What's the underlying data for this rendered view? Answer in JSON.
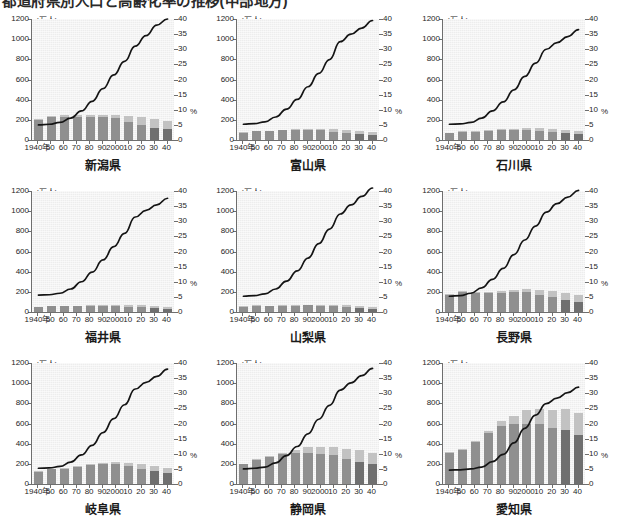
{
  "heading": {
    "text": "都道府県別人口と高齢化率の推移(中部地方)"
  },
  "axes": {
    "left_unit": "(万人)",
    "right_unit": "%",
    "left_ticks": [
      "1200",
      "1000",
      "800",
      "600",
      "400",
      "200",
      "0"
    ],
    "left_tick_values": [
      1200,
      1000,
      800,
      600,
      400,
      200,
      0
    ],
    "right_ticks": [
      "40",
      "35",
      "30",
      "25",
      "20",
      "15",
      "10",
      "5",
      "0"
    ],
    "right_tick_values": [
      40,
      35,
      30,
      25,
      20,
      15,
      10,
      5,
      0
    ],
    "x_ticks": [
      "1940年",
      "50",
      "60",
      "70",
      "80",
      "90",
      "2000",
      "10",
      "20",
      "30",
      "40"
    ],
    "left_range": [
      0,
      1200
    ],
    "right_range": [
      0,
      40
    ],
    "grid": false,
    "legend_position": "none"
  },
  "colors": {
    "panel_background": "#ededed",
    "axis": "#6e6e6e",
    "bar_lower": "#8f8f8f",
    "bar_upper": "#c2c2c2",
    "bar_lower_dark": "#6f6f6f",
    "line": "#141414",
    "text": "#262626"
  },
  "chart_data": [
    {
      "type": "bar",
      "title": "新潟県",
      "xlabel": "",
      "ylabel": "(万人)",
      "ylim": [
        0,
        1200
      ],
      "y2lim": [
        0,
        40
      ],
      "y2label": "%",
      "categories": [
        "1940年",
        "50",
        "60",
        "70",
        "80",
        "90",
        "2000",
        "10",
        "20",
        "30",
        "40"
      ],
      "series": [
        {
          "name": "bar-lower",
          "values": [
            200,
            228,
            232,
            232,
            228,
            224,
            216,
            176,
            148,
            120,
            108
          ]
        },
        {
          "name": "bar-upper",
          "values": [
            6,
            12,
            12,
            12,
            16,
            20,
            28,
            58,
            76,
            84,
            76
          ]
        },
        {
          "name": "aging-rate-line",
          "axis": "right",
          "values": [
            5.0,
            5.2,
            5.8,
            7.2,
            9.6,
            12.8,
            17.0,
            21.5,
            26.0,
            31.0,
            34.5,
            38.0,
            40.0
          ]
        }
      ]
    },
    {
      "type": "bar",
      "title": "富山県",
      "xlabel": "",
      "ylabel": "(万人)",
      "ylim": [
        0,
        1200
      ],
      "y2lim": [
        0,
        40
      ],
      "y2label": "%",
      "categories": [
        "1940年",
        "50",
        "60",
        "70",
        "80",
        "90",
        "2000",
        "10",
        "20",
        "30",
        "40"
      ],
      "series": [
        {
          "name": "bar-lower",
          "values": [
            72,
            88,
            88,
            96,
            100,
            100,
            96,
            84,
            72,
            60,
            52
          ]
        },
        {
          "name": "bar-upper",
          "values": [
            4,
            6,
            6,
            8,
            8,
            12,
            16,
            24,
            32,
            32,
            28
          ]
        },
        {
          "name": "aging-rate-line",
          "axis": "right",
          "values": [
            5.2,
            5.4,
            6.0,
            7.6,
            10.2,
            13.4,
            17.6,
            22.0,
            26.6,
            32.5,
            35.0,
            37.0,
            39.5
          ]
        }
      ]
    },
    {
      "type": "bar",
      "title": "石川県",
      "xlabel": "",
      "ylabel": "(万人)",
      "ylim": [
        0,
        1200
      ],
      "y2lim": [
        0,
        40
      ],
      "y2label": "%",
      "categories": [
        "1940年",
        "50",
        "60",
        "70",
        "80",
        "90",
        "2000",
        "10",
        "20",
        "30",
        "40"
      ],
      "series": [
        {
          "name": "bar-lower",
          "values": [
            68,
            84,
            84,
            88,
            96,
            100,
            100,
            92,
            80,
            68,
            58
          ]
        },
        {
          "name": "bar-upper",
          "values": [
            4,
            6,
            6,
            8,
            10,
            12,
            16,
            24,
            30,
            32,
            30
          ]
        },
        {
          "name": "aging-rate-line",
          "axis": "right",
          "values": [
            5.2,
            5.3,
            5.8,
            7.2,
            9.6,
            12.6,
            16.6,
            21.0,
            25.4,
            30.0,
            32.2,
            34.2,
            36.5
          ]
        }
      ]
    },
    {
      "type": "bar",
      "title": "福井県",
      "xlabel": "",
      "ylabel": "(万人)",
      "ylim": [
        0,
        1200
      ],
      "y2lim": [
        0,
        40
      ],
      "y2label": "%",
      "categories": [
        "1940年",
        "50",
        "60",
        "70",
        "80",
        "90",
        "2000",
        "10",
        "20",
        "30",
        "40"
      ],
      "series": [
        {
          "name": "bar-lower",
          "values": [
            48,
            56,
            56,
            58,
            60,
            62,
            60,
            54,
            48,
            40,
            34
          ]
        },
        {
          "name": "bar-upper",
          "values": [
            3,
            4,
            4,
            5,
            6,
            8,
            10,
            16,
            20,
            22,
            20
          ]
        },
        {
          "name": "aging-rate-line",
          "axis": "right",
          "values": [
            5.6,
            5.7,
            6.2,
            7.6,
            10.0,
            13.2,
            17.2,
            21.6,
            26.0,
            31.4,
            33.6,
            35.4,
            37.6
          ]
        }
      ]
    },
    {
      "type": "bar",
      "title": "山梨県",
      "xlabel": "",
      "ylabel": "(万人)",
      "ylim": [
        0,
        1200
      ],
      "y2lim": [
        0,
        40
      ],
      "y2label": "%",
      "categories": [
        "1940年",
        "50",
        "60",
        "70",
        "80",
        "90",
        "2000",
        "10",
        "20",
        "30",
        "40"
      ],
      "series": [
        {
          "name": "bar-lower",
          "values": [
            52,
            62,
            60,
            60,
            64,
            66,
            64,
            58,
            50,
            42,
            34
          ]
        },
        {
          "name": "bar-upper",
          "values": [
            3,
            4,
            4,
            5,
            6,
            8,
            10,
            16,
            20,
            22,
            20
          ]
        },
        {
          "name": "aging-rate-line",
          "axis": "right",
          "values": [
            5.2,
            5.4,
            6.0,
            7.6,
            10.2,
            13.6,
            17.8,
            22.6,
            27.4,
            32.4,
            35.4,
            38.2,
            41.0
          ]
        }
      ]
    },
    {
      "type": "bar",
      "title": "長野県",
      "xlabel": "",
      "ylabel": "(万人)",
      "ylim": [
        0,
        1200
      ],
      "y2lim": [
        0,
        40
      ],
      "y2label": "%",
      "categories": [
        "1940年",
        "50",
        "60",
        "70",
        "80",
        "90",
        "2000",
        "10",
        "20",
        "30",
        "40"
      ],
      "series": [
        {
          "name": "bar-lower",
          "values": [
            172,
            200,
            192,
            188,
            192,
            196,
            196,
            168,
            144,
            120,
            104
          ]
        },
        {
          "name": "bar-upper",
          "values": [
            6,
            10,
            10,
            12,
            16,
            20,
            28,
            50,
            62,
            68,
            64
          ]
        },
        {
          "name": "aging-rate-line",
          "axis": "right",
          "values": [
            5.2,
            5.4,
            6.2,
            8.0,
            10.8,
            14.4,
            19.0,
            23.8,
            28.4,
            33.0,
            35.8,
            38.0,
            40.2
          ]
        }
      ]
    },
    {
      "type": "bar",
      "title": "岐阜県",
      "xlabel": "",
      "ylabel": "(万人)",
      "ylim": [
        0,
        1200
      ],
      "y2lim": [
        0,
        40
      ],
      "y2label": "%",
      "categories": [
        "1940年",
        "50",
        "60",
        "70",
        "80",
        "90",
        "2000",
        "10",
        "20",
        "30",
        "40"
      ],
      "series": [
        {
          "name": "bar-lower",
          "values": [
            120,
            144,
            148,
            168,
            184,
            196,
            196,
            180,
            152,
            128,
            108
          ]
        },
        {
          "name": "bar-upper",
          "values": [
            5,
            8,
            8,
            10,
            14,
            16,
            20,
            32,
            44,
            48,
            46
          ]
        },
        {
          "name": "aging-rate-line",
          "axis": "right",
          "values": [
            5.2,
            5.3,
            5.8,
            7.2,
            9.6,
            12.8,
            17.0,
            21.6,
            26.2,
            31.4,
            33.6,
            35.6,
            38.0
          ]
        }
      ]
    },
    {
      "type": "bar",
      "title": "静岡県",
      "xlabel": "",
      "ylabel": "(万人)",
      "ylim": [
        0,
        1200
      ],
      "y2lim": [
        0,
        40
      ],
      "y2label": "%",
      "categories": [
        "1940年",
        "50",
        "60",
        "70",
        "80",
        "90",
        "2000",
        "10",
        "20",
        "30",
        "40"
      ],
      "series": [
        {
          "name": "bar-lower",
          "values": [
            196,
            236,
            264,
            296,
            312,
            304,
            300,
            288,
            252,
            220,
            196
          ]
        },
        {
          "name": "bar-upper",
          "values": [
            6,
            10,
            12,
            16,
            28,
            64,
            72,
            84,
            96,
            116,
            112
          ]
        },
        {
          "name": "aging-rate-line",
          "axis": "right",
          "values": [
            5.0,
            5.2,
            5.6,
            7.0,
            9.4,
            12.4,
            16.6,
            21.4,
            26.0,
            31.0,
            33.4,
            35.8,
            38.2
          ]
        }
      ]
    },
    {
      "type": "bar",
      "title": "愛知県",
      "xlabel": "",
      "ylabel": "(万人)",
      "ylim": [
        0,
        1200
      ],
      "y2lim": [
        0,
        40
      ],
      "y2label": "%",
      "categories": [
        "1940年",
        "50",
        "60",
        "70",
        "80",
        "90",
        "2000",
        "10",
        "20",
        "30",
        "40"
      ],
      "series": [
        {
          "name": "bar-lower",
          "values": [
            312,
            336,
            412,
            504,
            572,
            596,
            600,
            596,
            560,
            540,
            484
          ]
        },
        {
          "name": "bar-upper",
          "values": [
            8,
            12,
            14,
            20,
            56,
            76,
            136,
            148,
            176,
            200,
            224
          ]
        },
        {
          "name": "aging-rate-line",
          "axis": "right",
          "values": [
            4.6,
            4.7,
            5.0,
            5.6,
            7.4,
            9.8,
            13.6,
            18.4,
            22.8,
            26.6,
            28.4,
            30.2,
            32.0
          ]
        }
      ]
    }
  ]
}
